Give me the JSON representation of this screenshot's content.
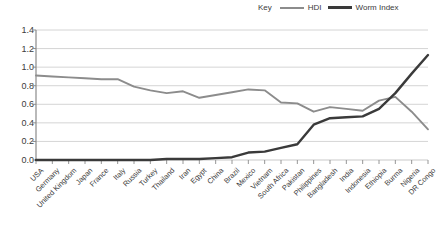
{
  "chart_data": {
    "type": "line",
    "title": "",
    "xlabel": "",
    "ylabel": "",
    "ylim": [
      0.0,
      1.4
    ],
    "ytick_step": 0.2,
    "yticks": [
      "0.0",
      "0.2",
      "0.4",
      "0.6",
      "0.8",
      "1.0",
      "1.2",
      "1.4"
    ],
    "grid": true,
    "legend_position": "top-right",
    "legend_title": "Key",
    "categories": [
      "USA",
      "Germany",
      "United Kingdom",
      "Japan",
      "France",
      "Italy",
      "Russia",
      "Turkey",
      "Thailand",
      "Iran",
      "Egypt",
      "China",
      "Brazil",
      "Mexico",
      "Vietnam",
      "South Africa",
      "Pakistan",
      "Philippines",
      "Bangladesh",
      "India",
      "Indonesia",
      "Ethiopia",
      "Burma",
      "Nigeria",
      "DR Congo"
    ],
    "series": [
      {
        "name": "HDI",
        "color": "#8c8c8c",
        "values": [
          0.91,
          0.9,
          0.89,
          0.88,
          0.87,
          0.87,
          0.79,
          0.75,
          0.72,
          0.74,
          0.67,
          0.7,
          0.73,
          0.76,
          0.75,
          0.62,
          0.61,
          0.52,
          0.57,
          0.55,
          0.53,
          0.64,
          0.68,
          0.52,
          0.33
        ]
      },
      {
        "name": "Worm Index",
        "color": "#3a3a3a",
        "values": [
          0.0,
          0.0,
          0.0,
          0.0,
          0.0,
          0.0,
          0.0,
          0.0,
          0.01,
          0.01,
          0.01,
          0.02,
          0.03,
          0.08,
          0.09,
          0.13,
          0.17,
          0.38,
          0.45,
          0.46,
          0.47,
          0.55,
          0.72,
          0.93,
          1.13
        ]
      }
    ]
  }
}
